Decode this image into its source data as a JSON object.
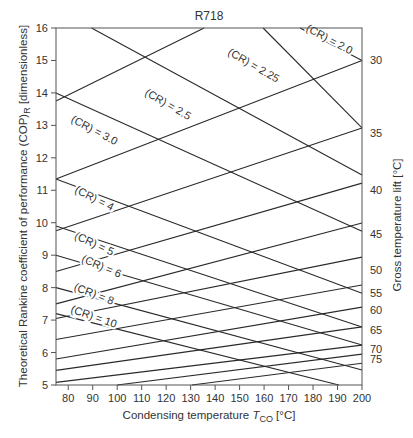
{
  "chart_data": {
    "type": "line",
    "title": "R718",
    "xlabel": "Condensing temperature T_CO [°C]",
    "xlabel_main": "Condensing temperature ",
    "xlabel_var": "T",
    "xlabel_sub": "CO",
    "xlabel_unit": " [°C]",
    "ylabel": "Theoretical Rankine coefficient of performance (COP)_R [dimensionless]",
    "ylabel_pre": "Theoretical Rankine coefficient of performance (COP)",
    "ylabel_sub": "R",
    "ylabel_post": " [dimensionless]",
    "y2label": "Gross temperature lift [°C]",
    "xlim": [
      75,
      200
    ],
    "ylim": [
      5,
      16
    ],
    "x_ticks": [
      80,
      90,
      100,
      110,
      120,
      130,
      140,
      150,
      160,
      170,
      180,
      190,
      200
    ],
    "y_ticks": [
      5,
      6,
      7,
      8,
      9,
      10,
      11,
      12,
      13,
      14,
      15,
      16
    ],
    "grid": false,
    "compression_ratio_series": [
      {
        "name": "(CR) = 2.0",
        "points": [
          [
            174.7,
            16.0
          ],
          [
            200,
            15.0
          ]
        ],
        "label_at": [
          186,
          15.55
        ],
        "label_angle": 28
      },
      {
        "name": "(CR) = 2.25",
        "points": [
          [
            159.6,
            16.0
          ],
          [
            200,
            12.92
          ]
        ],
        "label_at": [
          155,
          14.75
        ],
        "label_angle": 30
      },
      {
        "name": "(CR) = 2.5",
        "points": [
          [
            89.5,
            16.0
          ],
          [
            200,
            11.47
          ]
        ],
        "label_at": [
          120,
          13.55
        ],
        "label_angle": 30
      },
      {
        "name": "(CR) = 3.0",
        "points": [
          [
            75,
            14.0
          ],
          [
            200,
            9.74
          ]
        ],
        "label_at": [
          90,
          12.75
        ],
        "label_angle": 28
      },
      {
        "name": "(CR) = 4",
        "points": [
          [
            75,
            11.35
          ],
          [
            200,
            7.83
          ]
        ],
        "label_at": [
          90,
          10.65
        ],
        "label_angle": 27
      },
      {
        "name": "(CR) = 5",
        "points": [
          [
            75,
            9.9
          ],
          [
            200,
            6.79
          ]
        ],
        "label_at": [
          90,
          9.25
        ],
        "label_angle": 25
      },
      {
        "name": "(CR) = 6",
        "points": [
          [
            75,
            9.0
          ],
          [
            200,
            6.23
          ]
        ],
        "label_at": [
          93,
          8.55
        ],
        "label_angle": 23
      },
      {
        "name": "(CR) = 8",
        "points": [
          [
            75,
            8.0
          ],
          [
            200,
            5.46
          ]
        ],
        "label_at": [
          90,
          7.7
        ],
        "label_angle": 21
      },
      {
        "name": "(CR) = 10",
        "points": [
          [
            75,
            7.2
          ],
          [
            190.5,
            5.0
          ]
        ],
        "label_at": [
          90,
          7.0
        ],
        "label_angle": 19
      }
    ],
    "temperature_lift_series": [
      {
        "name": "25",
        "points": [
          [
            75,
            13.75
          ],
          [
            135.5,
            16.0
          ]
        ],
        "label": ""
      },
      {
        "name": "30",
        "points": [
          [
            75,
            11.35
          ],
          [
            200,
            15.0
          ]
        ],
        "label": "30"
      },
      {
        "name": "35",
        "points": [
          [
            75,
            9.75
          ],
          [
            200,
            12.92
          ]
        ],
        "label": "35"
      },
      {
        "name": "40",
        "points": [
          [
            75,
            8.5
          ],
          [
            200,
            11.22
          ]
        ],
        "label": "40"
      },
      {
        "name": "45",
        "points": [
          [
            75,
            7.5
          ],
          [
            200,
            9.99
          ]
        ],
        "label": "45"
      },
      {
        "name": "50",
        "points": [
          [
            75,
            7.05
          ],
          [
            200,
            8.94
          ]
        ],
        "label": "50"
      },
      {
        "name": "55",
        "points": [
          [
            75,
            6.4
          ],
          [
            200,
            8.08
          ]
        ],
        "label": "55"
      },
      {
        "name": "60",
        "points": [
          [
            75,
            5.8
          ],
          [
            200,
            7.4
          ]
        ],
        "label": "60"
      },
      {
        "name": "65",
        "points": [
          [
            75,
            5.45
          ],
          [
            200,
            6.79
          ]
        ],
        "label": "65"
      },
      {
        "name": "70",
        "points": [
          [
            75,
            5.08
          ],
          [
            200,
            6.23
          ]
        ],
        "label": "70"
      },
      {
        "name": "75",
        "points": [
          [
            100,
            5.0
          ],
          [
            200,
            5.95
          ]
        ],
        "label": "75"
      },
      {
        "name": "80",
        "points": [
          [
            130.5,
            5.0
          ],
          [
            200,
            5.67
          ]
        ],
        "label": ""
      }
    ],
    "y2_labels": [
      {
        "text": "30",
        "y": 15.0
      },
      {
        "text": "35",
        "y": 12.75
      },
      {
        "text": "40",
        "y": 11.0
      },
      {
        "text": "45",
        "y": 9.65
      },
      {
        "text": "50",
        "y": 8.55
      },
      {
        "text": "55",
        "y": 7.85
      },
      {
        "text": "60",
        "y": 7.3
      },
      {
        "text": "65",
        "y": 6.7
      },
      {
        "text": "70",
        "y": 6.1
      },
      {
        "text": "75",
        "y": 5.8
      }
    ]
  }
}
